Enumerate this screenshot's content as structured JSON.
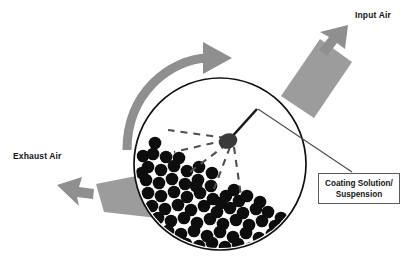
{
  "diagram": {
    "type": "process-schematic",
    "background_color": "#ffffff",
    "colors": {
      "duct_gray": "#9c9c9c",
      "arrow_gray": "#8f8f8f",
      "rotation_arrow_gray": "#8f8f8f",
      "particle_black": "#0d0d0d",
      "pan_outline": "#111111",
      "nozzle_dark": "#3a3a3a",
      "leader_line": "#4a4a4a",
      "callout_border": "#5a5a5a",
      "text": "#141414"
    },
    "labels": {
      "input_air": "Input Air",
      "exhaust_air": "Exhaust Air",
      "coating_line1": "Coating Solution/",
      "coating_line2": "Suspension"
    },
    "pan": {
      "center_x": 220,
      "center_y": 164,
      "radius": 86,
      "outline_width": 1.6,
      "fill": "#ffffff"
    },
    "nozzle": {
      "x": 229,
      "y": 140,
      "rx": 9,
      "ry": 7.5,
      "arm_points": "229,140 257,110 262,111",
      "spray_ray_count": 5
    },
    "spray_rays": [
      {
        "x2": 169,
        "y2": 131
      },
      {
        "x2": 176,
        "y2": 152
      },
      {
        "x2": 190,
        "y2": 172
      },
      {
        "x2": 215,
        "y2": 190
      },
      {
        "x2": 240,
        "y2": 196
      }
    ],
    "input_duct": {
      "polygon": "281,96 320,39 352,62 314,118",
      "arrow_points": "322,23 344,41 335,44 343,58 334,63 327,49 318,52"
    },
    "exhaust_duct": {
      "polygon": "96,184 161,171 175,220 104,212",
      "arrow_points": "84,176 60,187 69,191 62,199 72,204 79,195 86,197"
    },
    "rotation_arrow": {
      "arc_path": "M 127,148 C 127,92 170,58 211,57",
      "stroke_width": 9,
      "head_points": "205,43 232,57 205,71 205,61 205,53"
    },
    "leader_line": {
      "from_x": 259,
      "from_y": 110,
      "to_x": 352,
      "to_y": 172
    },
    "particle_bed": {
      "count": 68,
      "radius": 6.2,
      "description": "dense black spherical tablets filling lower-left quadrant of pan"
    }
  }
}
